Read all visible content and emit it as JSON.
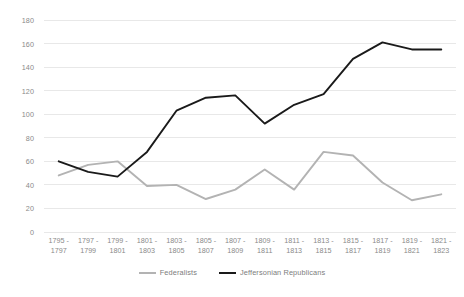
{
  "chart_data": {
    "type": "line",
    "title": "",
    "subtitle": "",
    "xlabel": "",
    "ylabel": "",
    "ylim": [
      0,
      180
    ],
    "ytick_step": 20,
    "yticks": [
      0,
      20,
      40,
      60,
      80,
      100,
      120,
      140,
      160,
      180
    ],
    "grid": true,
    "grid_axis": "y",
    "legend_position": "bottom",
    "categories": [
      "1795 - 1797",
      "1797 - 1799",
      "1799 - 1801",
      "1801 - 1803",
      "1803 - 1805",
      "1805 - 1807",
      "1807 - 1809",
      "1809 - 1811",
      "1811 - 1813",
      "1813 - 1815",
      "1815 - 1817",
      "1817 - 1819",
      "1819 - 1821",
      "1821 - 1823"
    ],
    "category_lines": [
      [
        "1795 -",
        "1797"
      ],
      [
        "1797 -",
        "1799"
      ],
      [
        "1799 -",
        "1801"
      ],
      [
        "1801 -",
        "1803"
      ],
      [
        "1803 -",
        "1805"
      ],
      [
        "1805 -",
        "1807"
      ],
      [
        "1807 -",
        "1809"
      ],
      [
        "1809 -",
        "1811"
      ],
      [
        "1811 -",
        "1813"
      ],
      [
        "1813 -",
        "1815"
      ],
      [
        "1815 -",
        "1817"
      ],
      [
        "1817 -",
        "1819"
      ],
      [
        "1819 -",
        "1821"
      ],
      [
        "1821 -",
        "1823"
      ]
    ],
    "series": [
      {
        "name": "Federalists",
        "color": "#b3b3b3",
        "values": [
          48,
          57,
          60,
          39,
          40,
          28,
          36,
          53,
          36,
          68,
          65,
          42,
          27,
          32
        ]
      },
      {
        "name": "Jeffersonian Republicans",
        "color": "#1a1a1a",
        "values": [
          60,
          51,
          47,
          68,
          103,
          114,
          116,
          92,
          108,
          117,
          147,
          161,
          155,
          155
        ]
      }
    ],
    "colors": {
      "federalists": "#b3b3b3",
      "jeffersonian_republicans": "#1a1a1a",
      "gridline": "#e8e8e8",
      "tick_label": "#8a8a8a",
      "legend_label": "#7d7d7d",
      "background": "#ffffff"
    }
  },
  "legend": {
    "items": [
      {
        "label": "Federalists"
      },
      {
        "label": "Jeffersonian Republicans"
      }
    ]
  }
}
